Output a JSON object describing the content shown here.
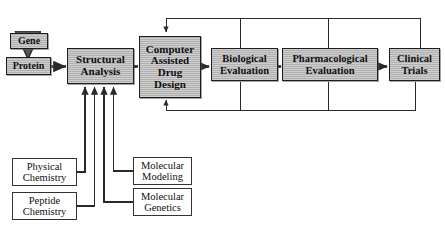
{
  "diagram": {
    "colors": {
      "shaded_fill": "#b9b9b9",
      "plain_fill": "#ffffff",
      "stroke": "#2a2a2a",
      "text": "#111111"
    },
    "pipeline": [
      {
        "id": "gene",
        "label": "Gene"
      },
      {
        "id": "protein",
        "label": "Protein"
      },
      {
        "id": "structural",
        "label": "Structural\nAnalysis"
      },
      {
        "id": "cadd",
        "label": "Computer\nAssisted\nDrug\nDesign"
      },
      {
        "id": "biological",
        "label": "Biological\nEvaluation"
      },
      {
        "id": "pharma",
        "label": "Pharmacological\nEvaluation"
      },
      {
        "id": "clinical",
        "label": "Clinical\nTrials"
      }
    ],
    "inputs": [
      {
        "id": "physical-chemistry",
        "label": "Physical\nChemistry"
      },
      {
        "id": "peptide-chemistry",
        "label": "Peptide\nChemistry"
      },
      {
        "id": "molecular-modeling",
        "label": "Molecular\nModeling"
      },
      {
        "id": "molecular-genetics",
        "label": "Molecular\nGenetics"
      }
    ],
    "connectors": [
      {
        "id": "gene-to-protein",
        "from": "gene",
        "to": "protein",
        "kind": "arrow-down"
      },
      {
        "id": "protein-to-structural",
        "from": "protein",
        "to": "structural",
        "kind": "arrow-right"
      },
      {
        "id": "structural-to-cadd",
        "from": "structural",
        "to": "cadd",
        "kind": "arrow-right"
      },
      {
        "id": "cadd-to-biological",
        "from": "cadd",
        "to": "biological",
        "kind": "arrow-right"
      },
      {
        "id": "biological-to-pharma",
        "from": "biological",
        "to": "pharma",
        "kind": "arrow-right"
      },
      {
        "id": "pharma-to-clinical",
        "from": "pharma",
        "to": "clinical",
        "kind": "arrow-right"
      },
      {
        "id": "physical-to-structural",
        "from": "physical-chemistry",
        "to": "structural",
        "kind": "elbow-up"
      },
      {
        "id": "peptide-to-structural",
        "from": "peptide-chemistry",
        "to": "structural",
        "kind": "elbow-up"
      },
      {
        "id": "modeling-to-structural",
        "from": "molecular-modeling",
        "to": "structural",
        "kind": "elbow-up"
      },
      {
        "id": "genetics-to-structural",
        "from": "molecular-genetics",
        "to": "structural",
        "kind": "elbow-up"
      },
      {
        "id": "feedback-top-to-cadd",
        "from": "clinical",
        "to": "cadd",
        "kind": "feedback-top"
      },
      {
        "id": "feedback-bottom-to-cadd",
        "from": "clinical",
        "to": "cadd",
        "kind": "feedback-bottom"
      }
    ]
  }
}
